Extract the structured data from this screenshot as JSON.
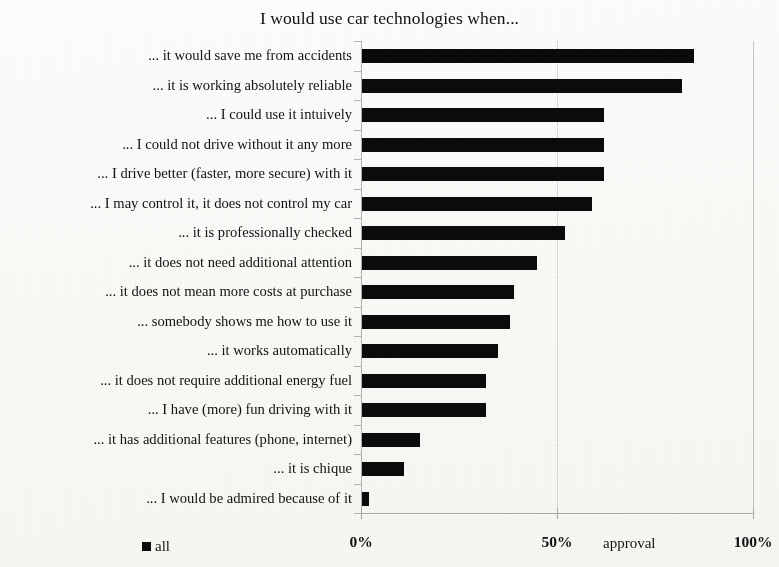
{
  "chart_data": {
    "type": "bar",
    "orientation": "horizontal",
    "title": "I would use car technologies when...",
    "xlabel": "approval",
    "ylabel": "",
    "xlim": [
      0,
      100
    ],
    "x_tick_labels": [
      "0%",
      "50%",
      "100%"
    ],
    "x_tick_values": [
      0,
      50,
      100
    ],
    "grid": true,
    "legend_position": "bottom-left",
    "bar_color": "#0b0b0b",
    "axis_color": "#b4b4b4",
    "grid_color": "#c9c9c9",
    "series": [
      {
        "name": "all",
        "values": [
          85,
          82,
          62,
          62,
          62,
          59,
          52,
          45,
          39,
          38,
          35,
          32,
          32,
          15,
          11,
          2
        ]
      }
    ],
    "categories": [
      "... it would save me from accidents",
      "... it is working absolutely reliable",
      "... I could use it intuively",
      "... I could not drive without it any more",
      "... I drive better (faster, more secure) with it",
      "... I may control it, it does not control my car",
      "... it is professionally checked",
      "... it does not need additional attention",
      "... it does not mean more costs at purchase",
      "... somebody shows me how to use it",
      "... it works automatically",
      "... it does not require additional energy fuel",
      "... I have (more) fun driving with it",
      "... it has additional features (phone, internet)",
      "... it is chique",
      "... I would be admired because of it"
    ]
  },
  "legend": {
    "entries": [
      {
        "label": "all",
        "color": "#0b0b0b",
        "marker": "square-marker"
      }
    ]
  }
}
